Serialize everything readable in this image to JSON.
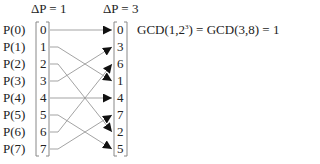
{
  "headers": {
    "left": "ΔP = 1",
    "right": "ΔP = 3"
  },
  "process_labels": [
    "P(0)",
    "P(1)",
    "P(2)",
    "P(3)",
    "P(4)",
    "P(5)",
    "P(6)",
    "P(7)"
  ],
  "left_column": [
    "0",
    "1",
    "2",
    "3",
    "4",
    "5",
    "6",
    "7"
  ],
  "right_column": [
    "0",
    "3",
    "6",
    "1",
    "4",
    "7",
    "2",
    "5"
  ],
  "mapping": [
    0,
    3,
    6,
    1,
    4,
    7,
    2,
    5
  ],
  "equation": {
    "prefix": "GCD(1,2",
    "superscript": "3",
    "suffix": ") = GCD(3,8) = 1"
  },
  "colors": {
    "line": "#999999",
    "arrow": "#111111",
    "bracket": "#888888",
    "text": "#222222"
  }
}
